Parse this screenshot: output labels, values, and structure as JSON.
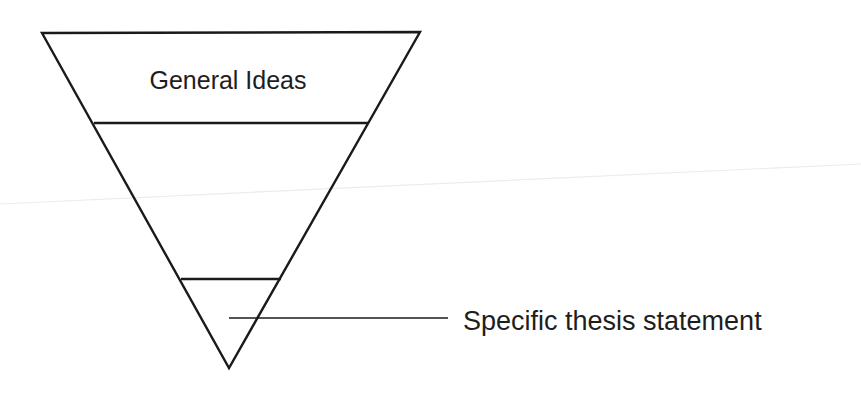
{
  "diagram": {
    "type": "inverted-funnel",
    "colors": {
      "stroke": "#1a1a1a",
      "text": "#1e1e1e",
      "background": "#ffffff"
    },
    "sections": [
      {
        "id": "top",
        "label": "General Ideas"
      },
      {
        "id": "middle",
        "label": ""
      },
      {
        "id": "bottom",
        "label": ""
      }
    ],
    "callout": {
      "label": "Specific thesis statement",
      "target": "bottom"
    }
  }
}
